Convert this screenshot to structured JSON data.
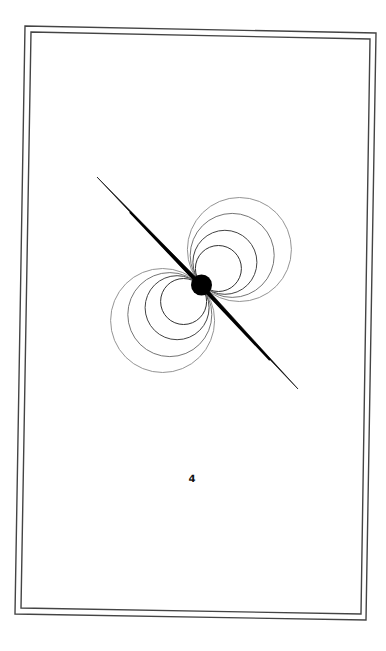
{
  "card": {
    "page_number": "4",
    "frame": {
      "outer_corners": [
        [
          25,
          26
        ],
        [
          376,
          33
        ],
        [
          366,
          620
        ],
        [
          15,
          614
        ]
      ],
      "inner_corners": [
        [
          31,
          32
        ],
        [
          370,
          39
        ],
        [
          361,
          614
        ],
        [
          21,
          608
        ]
      ],
      "stroke_color": "#444444"
    }
  },
  "illustration": {
    "description": "dipole magnetic field lines around a central body with a tilted axis",
    "center": [
      201,
      285
    ],
    "body_radius": 10.5,
    "axis": {
      "start": [
        97,
        177
      ],
      "end": [
        298,
        389
      ],
      "color": "#000000"
    },
    "field_loop_radii": [
      24,
      33,
      43,
      53
    ],
    "loop_colors": [
      "#333333",
      "#444444",
      "#666666",
      "#888888"
    ]
  }
}
